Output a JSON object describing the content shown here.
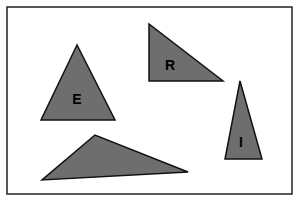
{
  "diagram": {
    "frame": {
      "stroke": "#222222",
      "background": "#ffffff"
    },
    "fill_color": "#6e6e6e",
    "stroke_color": "#111111",
    "shapes": [
      {
        "id": "E",
        "label": "E",
        "kind": "triangle",
        "points": "77,45 41,120 115,120",
        "label_x": 77,
        "label_y": 104
      },
      {
        "id": "R",
        "label": "R",
        "kind": "right-triangle",
        "points": "149,24 149,81 223,81",
        "label_x": 170,
        "label_y": 70
      },
      {
        "id": "I",
        "label": "I",
        "kind": "narrow-triangle",
        "points": "240,81 225,159 262,159",
        "label_x": 241,
        "label_y": 147
      },
      {
        "id": "unlabeled",
        "label": "",
        "kind": "obtuse-triangle",
        "points": "95,135 42,180 188,172",
        "label_x": 0,
        "label_y": 0
      }
    ]
  }
}
